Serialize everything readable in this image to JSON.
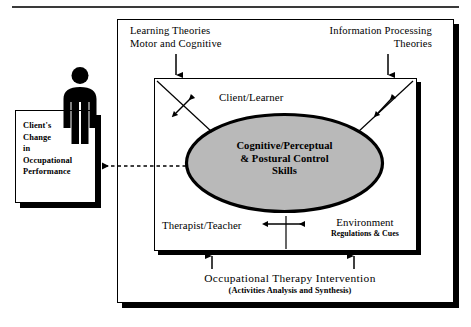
{
  "diagram": {
    "colors": {
      "oval_fill": "#b9b9b9",
      "stroke": "#000000",
      "background": "#ffffff",
      "shadow": "#000000"
    },
    "client_box": {
      "text": "Client's\nChange\nin\nOccupational\nPerformance"
    },
    "person": {
      "label": "client-person-pictogram"
    },
    "top_labels": {
      "left": "Learning Theories\nMotor and Cognitive",
      "right": "Information Processing\nTheories"
    },
    "inner_box": {
      "top_label": "Client/Learner",
      "bottom_left_label": "Therapist/Teacher",
      "bottom_right_label": "Environment",
      "bottom_right_sublabel": "Regulations & Cues"
    },
    "oval": {
      "text": "Cognitive/Perceptual\n& Postural Control\nSkills"
    },
    "bottom_labels": {
      "main": "Occupational Therapy Intervention",
      "sub": "(Activities Analysis and Synthesis)"
    }
  }
}
